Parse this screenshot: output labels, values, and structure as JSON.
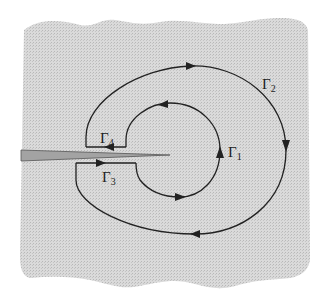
{
  "figure": {
    "background_color": "#d4d4d4",
    "line_color": "#222222",
    "crack_color": "#9a9a9a",
    "labels": {
      "gamma1": {
        "base": "Γ",
        "sub": "1"
      },
      "gamma2": {
        "base": "Γ",
        "sub": "2"
      },
      "gamma3": {
        "base": "Γ",
        "sub": "3"
      },
      "gamma4": {
        "base": "Γ",
        "sub": "4"
      }
    }
  }
}
